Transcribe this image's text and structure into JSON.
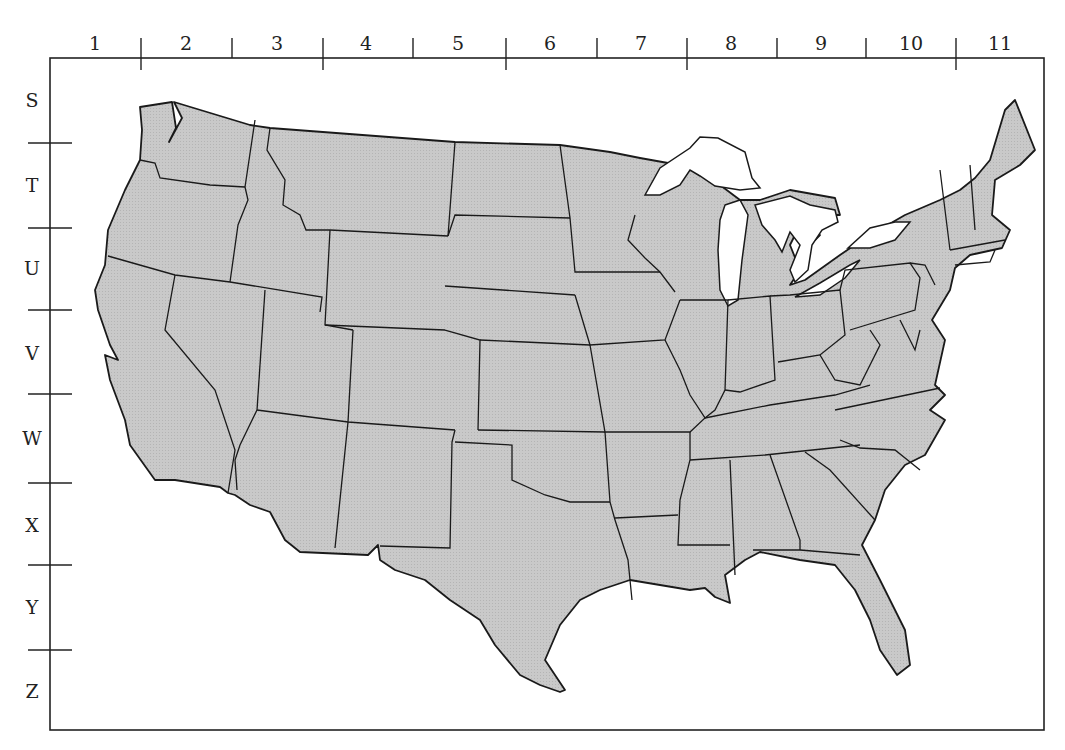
{
  "map": {
    "title": "Grid map of the contiguous United States",
    "land_color": "#c8c8c8",
    "water_color": "#ffffff",
    "border_color": "#1a1a1a",
    "frame": {
      "left": 50,
      "top": 58,
      "right": 1044,
      "bottom": 730
    }
  },
  "grid": {
    "columns": [
      {
        "label": "1",
        "x": 95
      },
      {
        "label": "2",
        "x": 186
      },
      {
        "label": "3",
        "x": 277
      },
      {
        "label": "4",
        "x": 366
      },
      {
        "label": "5",
        "x": 458
      },
      {
        "label": "6",
        "x": 550
      },
      {
        "label": "7",
        "x": 641
      },
      {
        "label": "8",
        "x": 731
      },
      {
        "label": "9",
        "x": 821
      },
      {
        "label": "10",
        "x": 911
      },
      {
        "label": "11",
        "x": 1000
      }
    ],
    "column_ticks": [
      141,
      232,
      323,
      413,
      506,
      597,
      687,
      777,
      866,
      956
    ],
    "rows": [
      {
        "label": "S",
        "y": 100
      },
      {
        "label": "T",
        "y": 185
      },
      {
        "label": "U",
        "y": 268
      },
      {
        "label": "V",
        "y": 353
      },
      {
        "label": "W",
        "y": 438
      },
      {
        "label": "X",
        "y": 525
      },
      {
        "label": "Y",
        "y": 607
      },
      {
        "label": "Z",
        "y": 691
      }
    ],
    "row_ticks": [
      143,
      228,
      310,
      394,
      483,
      565,
      650
    ]
  }
}
